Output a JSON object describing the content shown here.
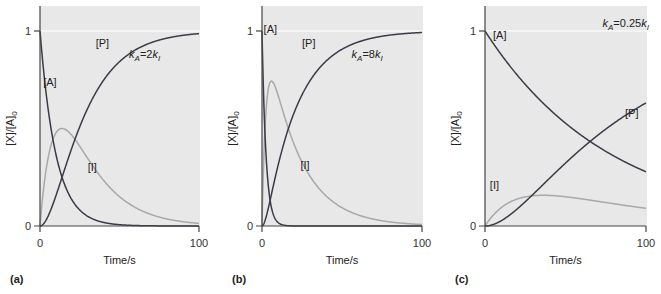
{
  "figure": {
    "panels": [
      {
        "tag": "(a)",
        "rate_label": {
          "k": "k",
          "sub_a": "A",
          "eq": "=2",
          "k2": "k",
          "sub_i": "I"
        },
        "series_labels": {
          "A": "[A]",
          "I": "[I]",
          "P": "[P]"
        }
      },
      {
        "tag": "(b)",
        "rate_label": {
          "k": "k",
          "sub_a": "A",
          "eq": "=8",
          "k2": "k",
          "sub_i": "I"
        },
        "series_labels": {
          "A": "[A]",
          "I": "[I]",
          "P": "[P]"
        }
      },
      {
        "tag": "(c)",
        "rate_label": {
          "k": "k",
          "sub_a": "A",
          "eq": "=0.25",
          "k2": "k",
          "sub_i": "I"
        },
        "series_labels": {
          "A": "[A]",
          "I": "[I]",
          "P": "[P]"
        }
      }
    ],
    "axis": {
      "ylabel": "[X]/[A]",
      "ylabel_sub": "0",
      "xlabel": "Time/s",
      "xticks": [
        "0",
        "100"
      ],
      "yticks": [
        "0",
        "1"
      ]
    },
    "colors": {
      "plot_bg": "#e8e8e8",
      "dark_curve": "#3a3a48",
      "light_curve": "#a8a8a8",
      "axis": "#444444",
      "ref_line": "#ffffff"
    }
  },
  "chart_data": [
    {
      "type": "line",
      "title": "(a) kA = 2kI",
      "xlabel": "Time/s",
      "ylabel": "[X]/[A]0",
      "xlim": [
        0,
        100
      ],
      "ylim": [
        0,
        1.1
      ],
      "grid": false,
      "legend": "inline labels",
      "kinetics": {
        "kA": 0.1,
        "kI": 0.05
      },
      "x": [
        0,
        5,
        10,
        15,
        20,
        30,
        40,
        50,
        60,
        80,
        100
      ],
      "series": [
        {
          "name": "[A]",
          "values": [
            1.0,
            0.61,
            0.37,
            0.22,
            0.14,
            0.05,
            0.02,
            0.01,
            0.0,
            0.0,
            0.0
          ]
        },
        {
          "name": "[I]",
          "values": [
            0.0,
            0.34,
            0.48,
            0.5,
            0.47,
            0.37,
            0.27,
            0.16,
            0.1,
            0.04,
            0.01
          ]
        },
        {
          "name": "[P]",
          "values": [
            0.0,
            0.05,
            0.15,
            0.28,
            0.39,
            0.58,
            0.71,
            0.83,
            0.9,
            0.96,
            0.99
          ]
        }
      ]
    },
    {
      "type": "line",
      "title": "(b) kA = 8kI",
      "xlabel": "Time/s",
      "ylabel": "[X]/[A]0",
      "xlim": [
        0,
        100
      ],
      "ylim": [
        0,
        1.1
      ],
      "grid": false,
      "legend": "inline labels",
      "kinetics": {
        "kA": 0.4,
        "kI": 0.05
      },
      "x": [
        0,
        2,
        5,
        7,
        10,
        15,
        20,
        30,
        40,
        50,
        60,
        80,
        100
      ],
      "series": [
        {
          "name": "[A]",
          "values": [
            1.0,
            0.45,
            0.14,
            0.06,
            0.02,
            0.0,
            0.0,
            0.0,
            0.0,
            0.0,
            0.0,
            0.0,
            0.0
          ]
        },
        {
          "name": "[I]",
          "values": [
            0.0,
            0.51,
            0.73,
            0.74,
            0.66,
            0.54,
            0.42,
            0.25,
            0.15,
            0.09,
            0.06,
            0.02,
            0.01
          ]
        },
        {
          "name": "[P]",
          "values": [
            0.0,
            0.04,
            0.13,
            0.2,
            0.32,
            0.46,
            0.58,
            0.75,
            0.85,
            0.91,
            0.94,
            0.98,
            0.99
          ]
        }
      ]
    },
    {
      "type": "line",
      "title": "(c) kA = 0.25kI",
      "xlabel": "Time/s",
      "ylabel": "[X]/[A]0",
      "xlim": [
        0,
        100
      ],
      "ylim": [
        0,
        1.1
      ],
      "grid": false,
      "legend": "inline labels",
      "kinetics": {
        "kA": 0.0128,
        "kI": 0.0512
      },
      "x": [
        0,
        10,
        20,
        30,
        40,
        50,
        60,
        70,
        80,
        90,
        100
      ],
      "series": [
        {
          "name": "[A]",
          "values": [
            1.0,
            0.88,
            0.77,
            0.68,
            0.6,
            0.53,
            0.46,
            0.41,
            0.36,
            0.32,
            0.28
          ]
        },
        {
          "name": "[I]",
          "values": [
            0.0,
            0.11,
            0.15,
            0.16,
            0.16,
            0.15,
            0.14,
            0.13,
            0.12,
            0.11,
            0.1
          ]
        },
        {
          "name": "[P]",
          "values": [
            0.0,
            0.01,
            0.08,
            0.16,
            0.24,
            0.32,
            0.4,
            0.46,
            0.52,
            0.57,
            0.62
          ]
        }
      ]
    }
  ]
}
